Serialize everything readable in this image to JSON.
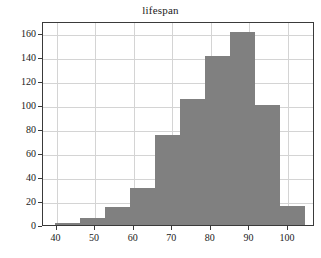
{
  "chart_data": {
    "type": "bar",
    "title": "lifespan",
    "xlabel": "",
    "ylabel": "",
    "grid": true,
    "legend": null,
    "xlim": [
      36.5,
      107.0
    ],
    "ylim": [
      0,
      170
    ],
    "xticks": [
      40,
      50,
      60,
      70,
      80,
      90,
      100
    ],
    "xtick_labels": [
      "40",
      "50",
      "60",
      "70",
      "80",
      "90",
      "100"
    ],
    "yticks": [
      0,
      20,
      40,
      60,
      80,
      100,
      120,
      140,
      160
    ],
    "ytick_labels": [
      "0",
      "20",
      "40",
      "60",
      "80",
      "100",
      "120",
      "140",
      "160"
    ],
    "bin_edges": [
      39.5,
      46.0,
      52.5,
      59.0,
      65.5,
      72.0,
      78.5,
      85.0,
      91.5,
      98.0,
      104.5
    ],
    "bin_centers": [
      42.75,
      49.25,
      55.75,
      62.25,
      68.75,
      75.25,
      81.75,
      88.25,
      94.75,
      101.25
    ],
    "values": [
      2,
      6,
      15,
      31,
      75,
      105,
      141,
      161,
      100,
      16
    ],
    "bar_color": "#808080",
    "bar_edge_color": "#808080",
    "grid_color": "#d4d4d4",
    "axis_color": "#3a3a3a",
    "background_color": "#ffffff",
    "text_color": "#1a1a1a"
  }
}
